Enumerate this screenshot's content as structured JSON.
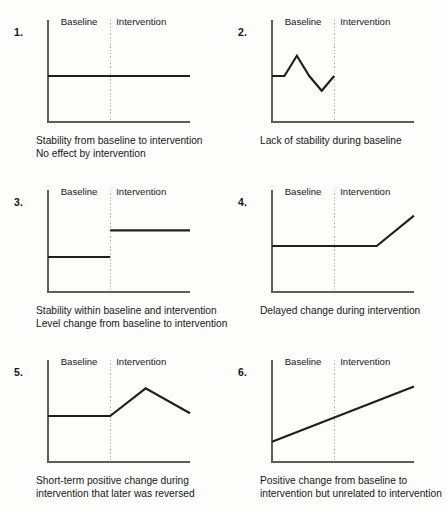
{
  "figure": {
    "background_color": "#fdfdfc",
    "line_color": "#1f1f1f",
    "axis_color": "#5d5d5d",
    "divider_color": "#b4b4b4",
    "phase_labels": {
      "baseline": "Baseline",
      "intervention": "Intervention"
    }
  },
  "panels": [
    {
      "index": "1.",
      "baseline_label": "Baseline",
      "intervention_label": "Intervention",
      "caption": "Stability from baseline to intervention\nNo effect by intervention",
      "chart_data": {
        "type": "line",
        "title": "Stability from baseline to intervention",
        "xlabel": "",
        "ylabel": "",
        "xlim": [
          0,
          160
        ],
        "ylim": [
          0,
          100
        ],
        "grid": false,
        "phase_divider_x": 70,
        "series": [
          {
            "name": "behavior",
            "x": [
              0,
              70,
              160
            ],
            "y": [
              50,
              50,
              50
            ]
          }
        ]
      }
    },
    {
      "index": "2.",
      "baseline_label": "Baseline",
      "intervention_label": "Intervention",
      "caption": "Lack of stability during baseline",
      "chart_data": {
        "type": "line",
        "title": "Lack of stability during baseline",
        "xlabel": "",
        "ylabel": "",
        "xlim": [
          0,
          160
        ],
        "ylim": [
          0,
          100
        ],
        "grid": false,
        "phase_divider_x": 70,
        "series": [
          {
            "name": "behavior",
            "x": [
              0,
              14,
              28,
              42,
              56,
              70
            ],
            "y": [
              50,
              50,
              72,
              50,
              34,
              50
            ]
          }
        ]
      }
    },
    {
      "index": "3.",
      "baseline_label": "Baseline",
      "intervention_label": "Intervention",
      "caption": "Stability within baseline and intervention\nLevel change from baseline to intervention",
      "chart_data": {
        "type": "line",
        "title": "Stability within baseline and intervention",
        "xlabel": "",
        "ylabel": "",
        "xlim": [
          0,
          160
        ],
        "ylim": [
          0,
          100
        ],
        "grid": false,
        "phase_divider_x": 70,
        "series": [
          {
            "name": "baseline-phase",
            "x": [
              0,
              70
            ],
            "y": [
              38,
              38
            ]
          },
          {
            "name": "intervention-phase",
            "x": [
              70,
              160
            ],
            "y": [
              67,
              67
            ]
          }
        ]
      }
    },
    {
      "index": "4.",
      "baseline_label": "Baseline",
      "intervention_label": "Intervention",
      "caption": "Delayed change during intervention",
      "chart_data": {
        "type": "line",
        "title": "Delayed change during intervention",
        "xlabel": "",
        "ylabel": "",
        "xlim": [
          0,
          160
        ],
        "ylim": [
          0,
          100
        ],
        "grid": false,
        "phase_divider_x": 70,
        "series": [
          {
            "name": "behavior",
            "x": [
              0,
              70,
              118,
              160
            ],
            "y": [
              50,
              50,
              50,
              83
            ]
          }
        ]
      }
    },
    {
      "index": "5.",
      "baseline_label": "Baseline",
      "intervention_label": "Intervention",
      "caption": "Short-term positive change during\nintervention that later was reversed",
      "chart_data": {
        "type": "line",
        "title": "Short-term positive change during intervention that later was reversed",
        "xlabel": "",
        "ylabel": "",
        "xlim": [
          0,
          160
        ],
        "ylim": [
          0,
          100
        ],
        "grid": false,
        "phase_divider_x": 70,
        "series": [
          {
            "name": "behavior",
            "x": [
              0,
              70,
              110,
              160
            ],
            "y": [
              50,
              50,
              80,
              53
            ]
          }
        ]
      }
    },
    {
      "index": "6.",
      "baseline_label": "Baseline",
      "intervention_label": "Intervention",
      "caption": "Positive change from baseline to\nintervention but unrelated to intervention",
      "chart_data": {
        "type": "line",
        "title": "Positive change from baseline to intervention but unrelated to intervention",
        "xlabel": "",
        "ylabel": "",
        "xlim": [
          0,
          160
        ],
        "ylim": [
          0,
          100
        ],
        "grid": false,
        "phase_divider_x": 70,
        "series": [
          {
            "name": "behavior",
            "x": [
              0,
              160
            ],
            "y": [
              22,
              82
            ]
          }
        ]
      }
    }
  ]
}
